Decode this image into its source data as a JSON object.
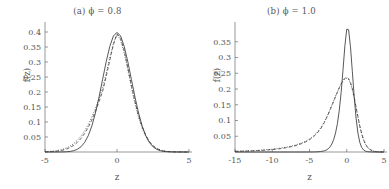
{
  "figure": {
    "background": "#ffffff",
    "ink": "#4a4a4a"
  },
  "chart_data": [
    {
      "id": "panel-a",
      "type": "line",
      "title": "(a) ϕ = 0.8",
      "xlabel": "z",
      "ylabel": "f(z)",
      "xlim": [
        -5,
        5
      ],
      "ylim": [
        0,
        0.42
      ],
      "xticks": [
        -5,
        0,
        5
      ],
      "xticklabels": [
        "-5",
        "0",
        "5"
      ],
      "yticks": [
        0.05,
        0.1,
        0.15,
        0.2,
        0.25,
        0.3,
        0.35,
        0.4
      ],
      "yticklabels": [
        "0.05",
        "0.1",
        "0.15",
        "0.2",
        "0.25",
        "0.3",
        "0.35",
        "0.4"
      ],
      "grid": false,
      "legend": "none",
      "series": [
        {
          "name": "solid",
          "style": "solid",
          "color": "#3a3a3a",
          "x": [
            -5,
            -4.75,
            -4.5,
            -4.25,
            -4,
            -3.75,
            -3.5,
            -3.25,
            -3,
            -2.75,
            -2.5,
            -2.25,
            -2,
            -1.75,
            -1.5,
            -1.25,
            -1,
            -0.75,
            -0.5,
            -0.25,
            0,
            0.25,
            0.5,
            0.75,
            1,
            1.25,
            1.5,
            1.75,
            2,
            2.25,
            2.5,
            2.75,
            3,
            3.25,
            3.5,
            3.75,
            4,
            4.25,
            4.5,
            4.75,
            5
          ],
          "y": [
            0.0,
            0.0,
            0.0001,
            0.0001,
            0.0002,
            0.0004,
            0.0009,
            0.002,
            0.0044,
            0.0091,
            0.0175,
            0.0317,
            0.054,
            0.0863,
            0.1295,
            0.1826,
            0.242,
            0.3011,
            0.3521,
            0.3867,
            0.3989,
            0.3867,
            0.3521,
            0.3011,
            0.242,
            0.1826,
            0.1295,
            0.0863,
            0.054,
            0.0317,
            0.0175,
            0.0091,
            0.0044,
            0.002,
            0.0009,
            0.0004,
            0.0002,
            0.0001,
            0.0001,
            0.0,
            0.0
          ]
        },
        {
          "name": "dashed",
          "style": "dashed",
          "color": "#3a3a3a",
          "x": [
            -5,
            -4.75,
            -4.5,
            -4.25,
            -4,
            -3.75,
            -3.5,
            -3.25,
            -3,
            -2.75,
            -2.5,
            -2.25,
            -2,
            -1.75,
            -1.5,
            -1.25,
            -1,
            -0.75,
            -0.5,
            -0.25,
            0,
            0.25,
            0.5,
            0.75,
            1,
            1.25,
            1.5,
            1.75,
            2,
            2.25,
            2.5,
            2.75,
            3,
            3.25,
            3.5,
            3.75,
            4,
            4.25,
            4.5,
            4.75,
            5
          ],
          "y": [
            0.0004,
            0.0008,
            0.0014,
            0.0024,
            0.004,
            0.0064,
            0.01,
            0.0152,
            0.0224,
            0.0322,
            0.045,
            0.0614,
            0.0818,
            0.1064,
            0.135,
            0.1672,
            0.202,
            0.2516,
            0.306,
            0.358,
            0.394,
            0.379,
            0.338,
            0.282,
            0.223,
            0.168,
            0.121,
            0.0838,
            0.0556,
            0.0352,
            0.0212,
            0.0122,
            0.0066,
            0.0034,
            0.0017,
            0.0008,
            0.0004,
            0.0002,
            0.0001,
            0.0,
            0.0
          ]
        },
        {
          "name": "dotted",
          "style": "dotted",
          "color": "#3a3a3a",
          "x": [
            -5,
            -4.75,
            -4.5,
            -4.25,
            -4,
            -3.75,
            -3.5,
            -3.25,
            -3,
            -2.75,
            -2.5,
            -2.25,
            -2,
            -1.75,
            -1.5,
            -1.25,
            -1,
            -0.75,
            -0.5,
            -0.25,
            0,
            0.25,
            0.5,
            0.75,
            1,
            1.25,
            1.5,
            1.75,
            2,
            2.25,
            2.5,
            2.75,
            3,
            3.25,
            3.5,
            3.75,
            4,
            4.25,
            4.5,
            4.75,
            5
          ],
          "y": [
            0.001,
            0.0016,
            0.0026,
            0.004,
            0.0062,
            0.0094,
            0.0138,
            0.02,
            0.0282,
            0.039,
            0.0528,
            0.07,
            0.091,
            0.116,
            0.145,
            0.178,
            0.214,
            0.262,
            0.314,
            0.362,
            0.393,
            0.373,
            0.33,
            0.274,
            0.215,
            0.161,
            0.115,
            0.079,
            0.052,
            0.0328,
            0.0198,
            0.0114,
            0.0063,
            0.0033,
            0.0016,
            0.0008,
            0.0004,
            0.0002,
            0.0001,
            0.0,
            0.0
          ]
        }
      ]
    },
    {
      "id": "panel-b",
      "type": "line",
      "title": "(b) ϕ = 1.0",
      "xlabel": "z",
      "ylabel": "f(z)",
      "xlim": [
        -15,
        5
      ],
      "ylim": [
        0,
        0.4
      ],
      "xticks": [
        -15,
        -10,
        -5,
        0,
        5
      ],
      "xticklabels": [
        "-15",
        "-10",
        "-5",
        "0",
        "5"
      ],
      "yticks": [
        0.05,
        0.1,
        0.15,
        0.2,
        0.25,
        0.3,
        0.35
      ],
      "yticklabels": [
        "0.05",
        "0.1",
        "0.15",
        "0.2",
        "0.25",
        "0.3",
        "0.35"
      ],
      "grid": false,
      "legend": "none",
      "series": [
        {
          "name": "solid",
          "style": "solid",
          "color": "#3a3a3a",
          "x": [
            -15,
            -14,
            -13,
            -12,
            -11,
            -10,
            -9,
            -8,
            -7,
            -6,
            -5,
            -4.5,
            -4,
            -3.5,
            -3,
            -2.75,
            -2.5,
            -2.25,
            -2,
            -1.75,
            -1.5,
            -1.25,
            -1,
            -0.75,
            -0.5,
            -0.25,
            0,
            0.25,
            0.5,
            0.75,
            1,
            1.25,
            1.5,
            1.75,
            2,
            2.25,
            2.5,
            2.75,
            3,
            3.5,
            4,
            4.5,
            5
          ],
          "y": [
            0.0,
            0.0,
            0.0,
            0.0,
            0.0,
            0.0,
            0.0,
            0.0,
            0.0,
            0.0,
            0.0001,
            0.0002,
            0.0005,
            0.0014,
            0.0038,
            0.0062,
            0.01,
            0.016,
            0.0254,
            0.0396,
            0.0606,
            0.0908,
            0.133,
            0.19,
            0.261,
            0.337,
            0.39,
            0.388,
            0.334,
            0.256,
            0.176,
            0.108,
            0.06,
            0.0306,
            0.0146,
            0.0066,
            0.0029,
            0.0012,
            0.0005,
            0.0001,
            0.0,
            0.0,
            0.0
          ]
        },
        {
          "name": "dashed",
          "style": "dashed",
          "color": "#3a3a3a",
          "x": [
            -15,
            -14,
            -13,
            -12,
            -11,
            -10,
            -9,
            -8,
            -7,
            -6,
            -5.5,
            -5,
            -4.5,
            -4,
            -3.5,
            -3,
            -2.75,
            -2.5,
            -2.25,
            -2,
            -1.75,
            -1.5,
            -1.25,
            -1,
            -0.75,
            -0.5,
            -0.25,
            0,
            0.25,
            0.5,
            0.75,
            1,
            1.25,
            1.5,
            1.75,
            2,
            2.25,
            2.5,
            2.75,
            3,
            3.5,
            4,
            4.5,
            5
          ],
          "y": [
            0.002,
            0.0026,
            0.0034,
            0.0044,
            0.0058,
            0.0078,
            0.0104,
            0.014,
            0.0192,
            0.027,
            0.0322,
            0.039,
            0.0476,
            0.059,
            0.074,
            0.094,
            0.106,
            0.119,
            0.133,
            0.147,
            0.161,
            0.176,
            0.19,
            0.204,
            0.216,
            0.227,
            0.234,
            0.237,
            0.233,
            0.221,
            0.201,
            0.174,
            0.143,
            0.112,
            0.083,
            0.0586,
            0.0396,
            0.0258,
            0.0162,
            0.0098,
            0.0032,
            0.0009,
            0.0002,
            0.0
          ]
        },
        {
          "name": "dotted",
          "style": "dotted",
          "color": "#3a3a3a",
          "x": [
            -15,
            -14,
            -13,
            -12,
            -11,
            -10,
            -9,
            -8,
            -7,
            -6,
            -5.5,
            -5,
            -4.5,
            -4,
            -3.5,
            -3,
            -2.75,
            -2.5,
            -2.25,
            -2,
            -1.75,
            -1.5,
            -1.25,
            -1,
            -0.75,
            -0.5,
            -0.25,
            0,
            0.25,
            0.5,
            0.75,
            1,
            1.25,
            1.5,
            1.75,
            2,
            2.25,
            2.5,
            2.75,
            3,
            3.5,
            4,
            4.5,
            5
          ],
          "y": [
            0.0024,
            0.0031,
            0.004,
            0.0052,
            0.0068,
            0.009,
            0.0119,
            0.0158,
            0.0212,
            0.0292,
            0.0346,
            0.0414,
            0.0502,
            0.0616,
            0.0764,
            0.096,
            0.108,
            0.121,
            0.1348,
            0.1488,
            0.163,
            0.1776,
            0.1912,
            0.2046,
            0.2164,
            0.226,
            0.2322,
            0.2344,
            0.2298,
            0.2176,
            0.1976,
            0.171,
            0.1404,
            0.1098,
            0.0814,
            0.0574,
            0.0388,
            0.0252,
            0.0158,
            0.0096,
            0.0031,
            0.0009,
            0.0002,
            0.0
          ]
        }
      ]
    }
  ]
}
